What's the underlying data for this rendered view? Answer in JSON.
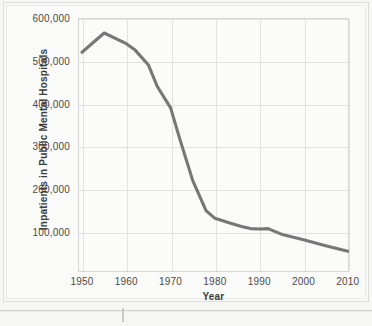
{
  "figure": {
    "background_color": "#f8f8f6",
    "plot_background_color": "#fbfbf9",
    "grid_color": "#e2e2e0",
    "line_color": "#777777"
  },
  "axes": {
    "x_title": "Year",
    "y_title": "Inpatients in Public Mental Hospitals",
    "x_ticks": [
      "1950",
      "1960",
      "1970",
      "1980",
      "1990",
      "2000",
      "2010"
    ],
    "y_ticks": [
      "100,000",
      "200,000",
      "300,000",
      "400,000",
      "500,000",
      "600,000"
    ]
  },
  "chart_data": {
    "type": "line",
    "title": "",
    "xlabel": "Year",
    "ylabel": "Inpatients in Public Mental Hospitals",
    "xlim": [
      1950,
      2010
    ],
    "ylim": [
      0,
      600000
    ],
    "grid": true,
    "legend": "none",
    "x": [
      1950,
      1955,
      1960,
      1962,
      1965,
      1967,
      1970,
      1972,
      1975,
      1978,
      1980,
      1983,
      1986,
      1988,
      1990,
      1992,
      1995,
      2000,
      2005,
      2010
    ],
    "values": [
      520000,
      565000,
      540000,
      525000,
      490000,
      440000,
      390000,
      320000,
      220000,
      150000,
      132000,
      122000,
      113000,
      108000,
      107000,
      108000,
      95000,
      82000,
      68000,
      55000
    ],
    "series": [
      {
        "name": "Inpatients in Public Mental Hospitals",
        "color": "#777777",
        "values": [
          520000,
          565000,
          540000,
          525000,
          490000,
          440000,
          390000,
          320000,
          220000,
          150000,
          132000,
          122000,
          113000,
          108000,
          107000,
          108000,
          95000,
          82000,
          68000,
          55000
        ]
      }
    ]
  }
}
